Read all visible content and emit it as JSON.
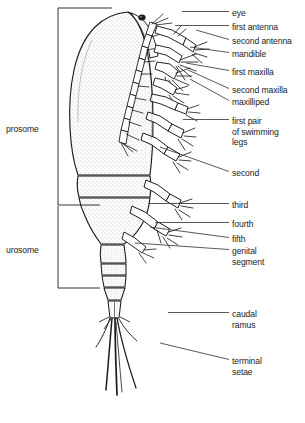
{
  "figure": {
    "background_color": "#ffffff",
    "ink_color": "#1b1b1b",
    "body_fill": "#fdfdfd",
    "stipple_color": "#8d8d8d"
  },
  "brackets": [
    {
      "id": "prosome",
      "label": "prosome",
      "x": 58,
      "y_top": 8,
      "y_bottom": 205,
      "label_x": 6,
      "label_y": 124
    },
    {
      "id": "urosome",
      "label": "urosome",
      "x": 58,
      "y_top": 205,
      "y_bottom": 288,
      "label_x": 6,
      "label_y": 245
    }
  ],
  "labels": [
    {
      "id": "eye",
      "lines": [
        "eye"
      ],
      "text_x": 232,
      "text_y": 8,
      "leader": {
        "x1": 182,
        "y1": 11.5,
        "x2": 229,
        "y2": 11.5
      }
    },
    {
      "id": "first-antenna",
      "lines": [
        "first antenna"
      ],
      "text_x": 232,
      "text_y": 22,
      "leader": {
        "x1": 175,
        "y1": 25.5,
        "x2": 229,
        "y2": 25.5
      }
    },
    {
      "id": "second-antenna",
      "lines": [
        "second antenna"
      ],
      "text_x": 232,
      "text_y": 36,
      "leader": {
        "x1": 196,
        "y1": 30,
        "x2": 229,
        "y2": 39.5
      }
    },
    {
      "id": "mandible",
      "lines": [
        "mandible"
      ],
      "text_x": 232,
      "text_y": 49,
      "leader": {
        "x1": 190,
        "y1": 47,
        "x2": 229,
        "y2": 52.5
      }
    },
    {
      "id": "first-maxilla",
      "lines": [
        "first maxilla"
      ],
      "text_x": 232,
      "text_y": 67,
      "leader": {
        "x1": 186,
        "y1": 63,
        "x2": 229,
        "y2": 70.5
      }
    },
    {
      "id": "second-maxilla",
      "lines": [
        "second maxilla"
      ],
      "text_x": 232,
      "text_y": 85,
      "leader": {
        "x1": 188,
        "y1": 70,
        "x2": 229,
        "y2": 88.5
      }
    },
    {
      "id": "maxilliped",
      "lines": [
        "maxilliped"
      ],
      "text_x": 232,
      "text_y": 97,
      "leader": {
        "x1": 190,
        "y1": 79,
        "x2": 229,
        "y2": 100.5
      }
    },
    {
      "id": "first-pair-swimming-legs",
      "lines": [
        "first pair",
        "of swimming",
        "legs"
      ],
      "text_x": 232,
      "text_y": 116,
      "leader": {
        "x1": 183,
        "y1": 119.5,
        "x2": 229,
        "y2": 119.5
      }
    },
    {
      "id": "second",
      "lines": [
        "second"
      ],
      "text_x": 232,
      "text_y": 168,
      "leader": {
        "x1": 160,
        "y1": 147,
        "x2": 229,
        "y2": 171.5
      }
    },
    {
      "id": "third",
      "lines": [
        "third"
      ],
      "text_x": 232,
      "text_y": 200,
      "leader": {
        "x1": 148,
        "y1": 203.5,
        "x2": 229,
        "y2": 203.5
      }
    },
    {
      "id": "fourth",
      "lines": [
        "fourth"
      ],
      "text_x": 232,
      "text_y": 219,
      "leader": {
        "x1": 155,
        "y1": 222.5,
        "x2": 229,
        "y2": 222.5
      }
    },
    {
      "id": "fifth",
      "lines": [
        "fifth"
      ],
      "text_x": 232,
      "text_y": 234,
      "leader": {
        "x1": 150,
        "y1": 227,
        "x2": 229,
        "y2": 237.5
      }
    },
    {
      "id": "genital-segment",
      "lines": [
        "genital",
        "segment"
      ],
      "text_x": 232,
      "text_y": 246,
      "leader": {
        "x1": 135,
        "y1": 243,
        "x2": 229,
        "y2": 249.5
      }
    },
    {
      "id": "caudal-ramus",
      "lines": [
        "caudal",
        "ramus"
      ],
      "text_x": 232,
      "text_y": 309,
      "leader": {
        "x1": 168,
        "y1": 312.5,
        "x2": 229,
        "y2": 312.5
      }
    },
    {
      "id": "terminal-setae",
      "lines": [
        "terminal",
        "setae"
      ],
      "text_x": 232,
      "text_y": 356,
      "leader": {
        "x1": 160,
        "y1": 343,
        "x2": 229,
        "y2": 359.5
      }
    }
  ],
  "anatomy_parts": [
    "cephalosome",
    "thorax-segment-1",
    "thorax-segment-2",
    "urosome-segments",
    "caudal-ramus",
    "terminal-setae",
    "eye",
    "first-antenna",
    "second-antenna",
    "mandible",
    "first-maxilla",
    "second-maxilla",
    "maxilliped",
    "swimming-legs"
  ]
}
